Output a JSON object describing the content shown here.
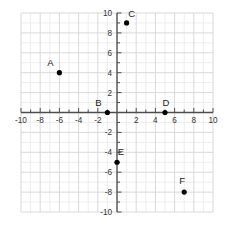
{
  "chart_data": {
    "type": "scatter",
    "title": "",
    "xlabel": "",
    "ylabel": "",
    "xlim": [
      -10,
      10
    ],
    "ylim": [
      -10,
      10
    ],
    "grid": true,
    "grid_major_step": 2,
    "grid_minor_step": 1,
    "legend": "none",
    "axis_color": "#4d4d4d",
    "grid_major_color": "#d9d9d9",
    "grid_minor_color": "#ededed",
    "point_color": "#000000",
    "x_tick_labels": [
      "-10",
      "-8",
      "-6",
      "-4",
      "-2",
      "2",
      "4",
      "6",
      "8",
      "10"
    ],
    "x_tick_values": [
      -10,
      -8,
      -6,
      -4,
      -2,
      2,
      4,
      6,
      8,
      10
    ],
    "y_tick_labels": [
      "10",
      "8",
      "6",
      "4",
      "2",
      "-2",
      "-4",
      "-6",
      "-8",
      "-10"
    ],
    "y_tick_values": [
      10,
      8,
      6,
      4,
      2,
      -2,
      -4,
      -6,
      -8,
      -10
    ],
    "points": [
      {
        "label": "A",
        "x": -6,
        "y": 4,
        "label_dx": -9,
        "label_dy": -7
      },
      {
        "label": "B",
        "x": -1,
        "y": 0,
        "label_dx": -9,
        "label_dy": -7
      },
      {
        "label": "C",
        "x": 1,
        "y": 9,
        "label_dx": 5,
        "label_dy": -6
      },
      {
        "label": "D",
        "x": 5,
        "y": 0,
        "label_dx": 1,
        "label_dy": -7
      },
      {
        "label": "E",
        "x": 0,
        "y": -5,
        "label_dx": 4,
        "label_dy": -7
      },
      {
        "label": "F",
        "x": 7,
        "y": -8,
        "label_dx": -2,
        "label_dy": -8
      }
    ]
  }
}
